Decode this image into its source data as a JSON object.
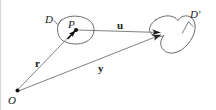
{
  "figure": {
    "kind": "vector-diagram",
    "background_color": "#ffffff",
    "stroke_color": "#4a4a4a",
    "text_color": "#1a1a1a",
    "width": 216,
    "height": 110,
    "labels": {
      "domain_source": "D",
      "domain_target": "D'",
      "point_p": "P",
      "vector_u": "u",
      "vector_r": "r",
      "vector_y": "y",
      "origin": "O"
    },
    "points": {
      "origin": {
        "x": 17,
        "y": 91
      },
      "point_p": {
        "x": 75,
        "y": 30
      },
      "target_point": {
        "x": 166,
        "y": 33
      }
    },
    "vectors": [
      {
        "name": "r",
        "from": "origin",
        "to": "point_p",
        "label": "r",
        "style": "thin-line"
      },
      {
        "name": "y",
        "from": "origin",
        "to": "target_point",
        "label": "y",
        "style": "thin-arrow"
      },
      {
        "name": "u",
        "from": "point_p",
        "to": "target_point",
        "label": "u",
        "style": "thin-arrow"
      },
      {
        "name": "displacement",
        "from": "point_p",
        "to": "point_p_offset",
        "label": "",
        "style": "short-bold-arrow"
      }
    ],
    "regions": [
      {
        "name": "source-region",
        "label": "D",
        "shape": "closed-blob-oval"
      },
      {
        "name": "target-region",
        "label": "D'",
        "shape": "closed-blob-heart"
      }
    ]
  }
}
